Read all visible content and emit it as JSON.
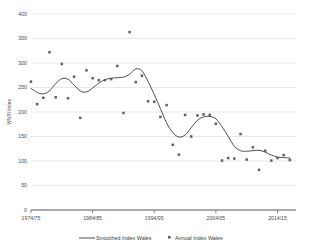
{
  "chart_data": {
    "type": "scatter",
    "title": "",
    "subtitle": "",
    "xlabel": "",
    "ylabel": "WNBI Index",
    "xlim": [
      1974,
      2017
    ],
    "ylim": [
      0,
      400
    ],
    "grid": true,
    "legend_position": "bottom",
    "y_ticks": [
      0,
      50,
      100,
      150,
      200,
      250,
      300,
      350,
      400
    ],
    "y_tick_labels": [
      "0",
      "50",
      "100",
      "150",
      "200",
      "250",
      "300",
      "350",
      "400"
    ],
    "x_ticks": [
      1974,
      1984,
      1994,
      2004,
      2014
    ],
    "x_tick_labels": [
      "1974/75",
      "1984/85",
      "1994/95",
      "2004/05",
      "2014/15"
    ],
    "x": [
      1974,
      1975,
      1976,
      1977,
      1978,
      1979,
      1980,
      1981,
      1982,
      1983,
      1984,
      1985,
      1986,
      1987,
      1988,
      1989,
      1990,
      1991,
      1992,
      1993,
      1994,
      1995,
      1996,
      1997,
      1998,
      1999,
      2000,
      2001,
      2002,
      2003,
      2004,
      2005,
      2006,
      2007,
      2008,
      2009,
      2010,
      2011,
      2012,
      2013,
      2014,
      2015,
      2016
    ],
    "series": [
      {
        "name": "Annual Index Wales",
        "type": "scatter",
        "marker": "square",
        "color": "#606060",
        "values": [
          262,
          216,
          229,
          322,
          230,
          298,
          228,
          272,
          188,
          285,
          269,
          265,
          265,
          267,
          294,
          198,
          363,
          261,
          274,
          222,
          221,
          190,
          214,
          133,
          113,
          194,
          150,
          193,
          195,
          194,
          176,
          101,
          106,
          105,
          155,
          103,
          128,
          82,
          121,
          101,
          106,
          112,
          102
        ]
      },
      {
        "name": "Smoothed Index Wales",
        "type": "line",
        "color": "#4d4d4d",
        "values": [
          248,
          240,
          237,
          243,
          258,
          268,
          267,
          255,
          243,
          241,
          249,
          259,
          266,
          269,
          270,
          271,
          277,
          288,
          284,
          262,
          236,
          207,
          178,
          158,
          149,
          153,
          168,
          183,
          190,
          191,
          186,
          170,
          150,
          130,
          121,
          120,
          121,
          122,
          118,
          112,
          108,
          107,
          106
        ]
      }
    ]
  },
  "legend": {
    "items": [
      {
        "label": "Smoothed Index Wales",
        "marker": "line",
        "color": "#4d4d4d"
      },
      {
        "label": "Annual Index Wales",
        "marker": "square",
        "color": "#606060"
      }
    ]
  },
  "axis": {
    "y_title": "WNBI Index"
  },
  "colors": {
    "grid": "#d9d9d9",
    "axis": "#595959",
    "line": "#4d4d4d",
    "marker": "#606060",
    "background": "#ffffff"
  }
}
